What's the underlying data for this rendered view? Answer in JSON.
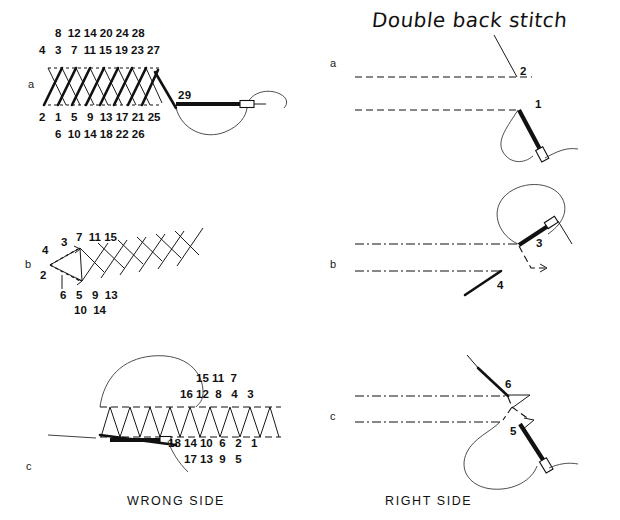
{
  "page": {
    "title": "Double back stitch",
    "background_color": "#ffffff",
    "ink_color": "#111111"
  },
  "captions": {
    "left": "WRONG SIDE",
    "right": "RIGHT SIDE"
  },
  "left_column": {
    "panels": [
      {
        "letter": "a",
        "name": "wrong-side-step-a",
        "number_rows": [
          {
            "position": "top-upper",
            "text": "8  12 14 20 24 28"
          },
          {
            "position": "top-lower",
            "text": "4   3   7  11 15 19 23 27"
          },
          {
            "position": "bottom-upper",
            "text": "2   1   5   9  13 17 21 25"
          },
          {
            "position": "bottom-lower",
            "text": "6  10 14 18 22 26"
          }
        ],
        "needle_label": "29"
      },
      {
        "letter": "b",
        "name": "wrong-side-step-b",
        "number_rows": [
          {
            "position": "top",
            "text": "7  11 15"
          },
          {
            "position": "top-left-upper",
            "text": "3"
          },
          {
            "position": "top-left",
            "text": "4"
          },
          {
            "position": "bottom-left",
            "text": "2"
          },
          {
            "position": "bottom-upper",
            "text": "6   5   9  13"
          },
          {
            "position": "bottom-lower",
            "text": "10  14"
          }
        ]
      },
      {
        "letter": "c",
        "name": "wrong-side-step-c",
        "number_rows": [
          {
            "position": "top-upper",
            "text": "15 11  7"
          },
          {
            "position": "top-lower",
            "text": "16 12  8   4   3"
          },
          {
            "position": "bottom-upper",
            "text": "18 14 10  6   2   1"
          },
          {
            "position": "bottom-lower",
            "text": "17 13  9   5"
          }
        ]
      }
    ]
  },
  "right_column": {
    "panels": [
      {
        "letter": "a",
        "name": "right-side-step-a",
        "labels": [
          "2",
          "1"
        ]
      },
      {
        "letter": "b",
        "name": "right-side-step-b",
        "labels": [
          "3",
          "4"
        ]
      },
      {
        "letter": "c",
        "name": "right-side-step-c",
        "labels": [
          "6",
          "5"
        ]
      }
    ]
  }
}
